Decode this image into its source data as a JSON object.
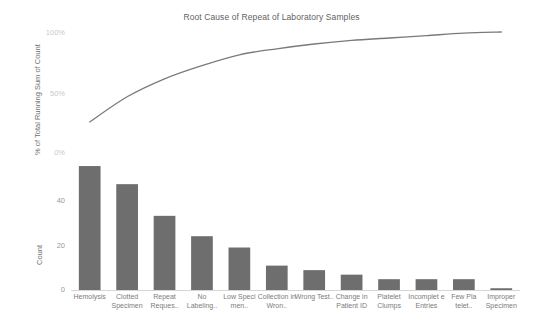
{
  "chart_data": {
    "type": "bar",
    "title": "Root Cause of Repeat of Laboratory Samples",
    "subtype": "pareto",
    "categories": [
      "Hemolysis",
      "Clotted Specimen",
      "Repeat Reques..",
      "No Labeling..",
      "Low Speci men..",
      "Collection in Wron..",
      "Wrong Test..",
      "Change in Patient ID",
      "Platelet Clumps",
      "Incomplet e Entries",
      "Few Pla telet..",
      "Improper Specimen"
    ],
    "series": [
      {
        "name": "Count",
        "type": "bar",
        "axis": "left-bottom",
        "values": [
          55,
          47,
          33,
          24,
          19,
          11,
          9,
          7,
          5,
          5,
          5,
          1
        ]
      },
      {
        "name": "% of Total Running Sum of Count",
        "type": "line",
        "axis": "left-top",
        "values": [
          25,
          46,
          61,
          72,
          81,
          86,
          90,
          93,
          95,
          97,
          99,
          100
        ]
      }
    ],
    "xlabel": "",
    "ylabel_top": "% of Total Running Sum of Count",
    "ylabel_bottom": "Count",
    "yticks_top": [
      "0%",
      "50%",
      "100%"
    ],
    "yticks_top_values": [
      0,
      50,
      100
    ],
    "ylim_top": [
      0,
      100
    ],
    "yticks_bottom": [
      "0",
      "20",
      "40"
    ],
    "yticks_bottom_values": [
      0,
      20,
      40
    ],
    "ylim_bottom": [
      0,
      58
    ],
    "grid": false,
    "legend": "none",
    "colors": {
      "bar": "#6e6e6e",
      "line": "#7a7a7a",
      "text": "#6b6b6b",
      "tick": "#9a9a9a",
      "axis": "#d6d6d6",
      "background": "#ffffff"
    }
  }
}
